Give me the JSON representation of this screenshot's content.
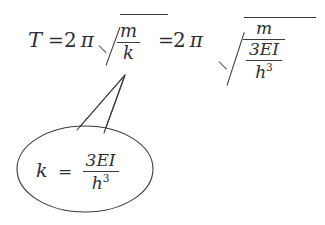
{
  "figure": {
    "kind": "handwritten-style-math-equation-with-callout",
    "ink_color": "#2f2f33",
    "background_color": "#ffffff"
  },
  "equation": {
    "lhs_symbol": "T",
    "equals_1": "=",
    "coefficient_1": "2",
    "pi_1": "π",
    "radical_1": {
      "symbol": "√",
      "numerator": "m",
      "denominator": "k"
    },
    "equals_2": "=",
    "coefficient_2": "2",
    "pi_2": "π",
    "radical_2": {
      "symbol": "√",
      "numerator": "m",
      "denominator": {
        "numerator": "3EI",
        "denominator_base": "h",
        "denominator_exponent": "3"
      }
    },
    "plain_text": "T = 2π√(m/k) = 2π√(m/(3EI/h³))"
  },
  "callout": {
    "pointer_target": "k",
    "content": {
      "lhs_symbol": "k",
      "equals": "=",
      "numerator": "3EI",
      "denominator_base": "h",
      "denominator_exponent": "3",
      "plain_text": "k = 3EI/h³"
    },
    "shape": "ellipse-with-triangular-tail",
    "stroke_color": "#3a3a3e",
    "fill_color": "#ffffff"
  }
}
